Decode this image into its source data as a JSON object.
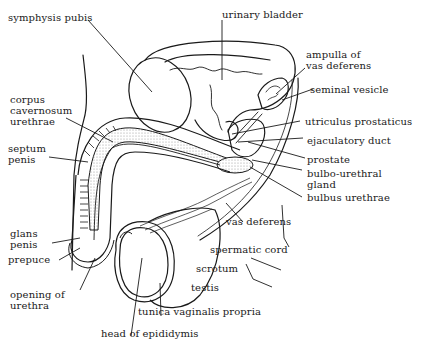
{
  "diagram": {
    "ink_color": "#1a1a1a",
    "stipple_color": "#bcbcbc",
    "labels": [
      {
        "id": "symphysis-pubis",
        "text": "symphysis pubis"
      },
      {
        "id": "urinary-bladder",
        "text": "urinary bladder"
      },
      {
        "id": "ampulla-of-vas-deferens",
        "line1": "ampulla of",
        "line2": "vas deferens"
      },
      {
        "id": "seminal-vesicle",
        "text": "seminal vesicle"
      },
      {
        "id": "corpus-cavernosum-urethrae",
        "line1": "corpus",
        "line2": "cavernosum",
        "line3": "urethrae"
      },
      {
        "id": "utriculus-prostaticus",
        "text": "utriculus prostaticus"
      },
      {
        "id": "ejaculatory-duct",
        "text": "ejaculatory duct"
      },
      {
        "id": "septum-penis",
        "line1": "septum",
        "line2": "penis"
      },
      {
        "id": "prostate",
        "text": "prostate"
      },
      {
        "id": "bulbo-urethral-gland",
        "line1": "bulbo-urethral",
        "line2": "gland"
      },
      {
        "id": "bulbus-urethrae",
        "text": "bulbus urethrae"
      },
      {
        "id": "vas-deferens",
        "text": "vas deferens"
      },
      {
        "id": "glans-penis",
        "line1": "glans",
        "line2": "penis"
      },
      {
        "id": "prepuce",
        "text": "prepuce"
      },
      {
        "id": "spermatic-cord",
        "text": "spermatic cord"
      },
      {
        "id": "scrotum",
        "text": "scrotum"
      },
      {
        "id": "opening-of-urethra",
        "line1": "opening of",
        "line2": "urethra"
      },
      {
        "id": "testis",
        "text": "testis"
      },
      {
        "id": "tunica-vaginalis-propria",
        "text": "tunica vaginalis propria"
      },
      {
        "id": "head-of-epididymis",
        "text": "head of epididymis"
      }
    ]
  }
}
